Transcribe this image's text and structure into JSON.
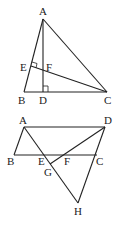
{
  "figure1": {
    "labels": {
      "A": "A",
      "B": "B",
      "C": "C",
      "D": "D",
      "E": "E",
      "F": "F"
    }
  },
  "figure2": {
    "labels": {
      "A": "A",
      "B": "B",
      "C": "C",
      "D": "D",
      "E": "E",
      "F": "F",
      "G": "G",
      "H": "H"
    }
  },
  "colors": {
    "stroke": "#222222",
    "background": "#ffffff"
  }
}
